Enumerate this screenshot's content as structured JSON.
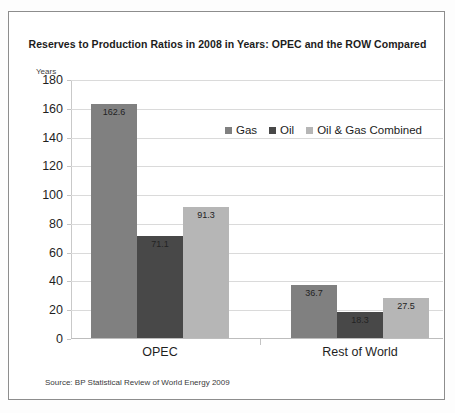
{
  "chart_data": {
    "type": "bar",
    "title": "Reserves to Production Ratios in 2008 in Years: OPEC and the ROW Compared",
    "xlabel": "",
    "ylabel": "Years",
    "ylim": [
      0,
      180
    ],
    "yticks": [
      180,
      160,
      140,
      120,
      100,
      80,
      60,
      40,
      20,
      0
    ],
    "grid": true,
    "legend_position": "inside-top-right",
    "categories": [
      "OPEC",
      "Rest of World"
    ],
    "series": [
      {
        "name": "Gas",
        "color": "#808080",
        "values": [
          162.6,
          36.7
        ]
      },
      {
        "name": "Oil",
        "color": "#484848",
        "values": [
          71.1,
          18.3
        ]
      },
      {
        "name": "Oil & Gas Combined",
        "color": "#b6b6b6",
        "values": [
          91.3,
          27.5
        ]
      }
    ],
    "source": "Source: BP Statistical Review of World Energy 2009"
  },
  "axis": {
    "unit_label": "Years"
  },
  "colors": {
    "gas": "#808080",
    "oil": "#484848",
    "combined": "#b6b6b6",
    "gridline": "#dadada",
    "frame": "#8d8d8d"
  }
}
